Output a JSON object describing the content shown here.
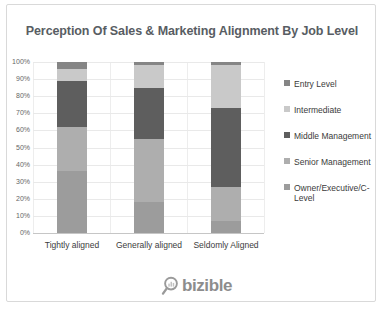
{
  "brand": {
    "logo_text": "bizible",
    "logo_color": "#8d8d8d"
  },
  "chart_data": {
    "type": "bar",
    "stacked": true,
    "units": "percent",
    "title": "Perception Of Sales & Marketing Alignment By Job Level",
    "categories": [
      "Tightly aligned",
      "Generally aligned",
      "Seldomly Aligned"
    ],
    "series_bottom_to_top": [
      {
        "name": "Owner/Executive/C-Level",
        "color": "#9c9c9c",
        "values": [
          36,
          18,
          7
        ]
      },
      {
        "name": "Senior Management",
        "color": "#aeaeae",
        "values": [
          26,
          37,
          20
        ]
      },
      {
        "name": "Middle Management",
        "color": "#5e5e5e",
        "values": [
          27,
          30,
          46
        ]
      },
      {
        "name": "Intermediate",
        "color": "#c9c9c9",
        "values": [
          7,
          13,
          25
        ]
      },
      {
        "name": "Entry Level",
        "color": "#858585",
        "values": [
          4,
          2,
          2
        ]
      }
    ],
    "legend": [
      "Entry Level",
      "Intermediate",
      "Middle Management",
      "Senior Management",
      "Owner/Executive/C-Level"
    ],
    "legend_position": "right",
    "y_axis": {
      "min": 0,
      "max": 100,
      "step": 10,
      "ticks": [
        "0%",
        "10%",
        "20%",
        "30%",
        "40%",
        "50%",
        "60%",
        "70%",
        "80%",
        "90%",
        "100%"
      ]
    },
    "grid": true
  }
}
